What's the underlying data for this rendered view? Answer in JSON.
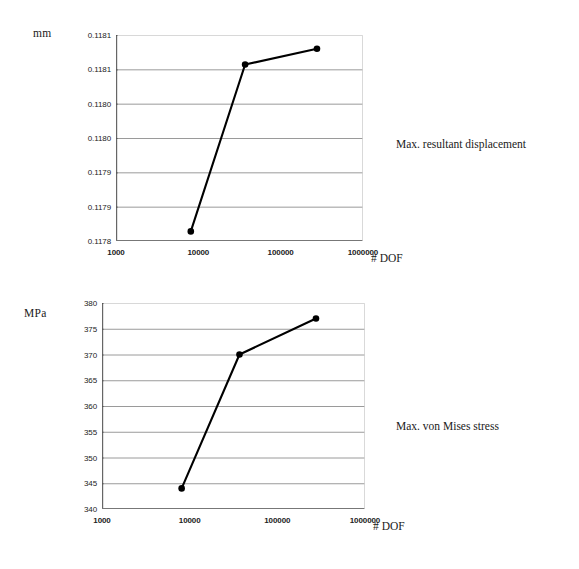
{
  "page": {
    "background": "#ffffff",
    "ink": "#1a1a1a",
    "gridline_color": "#9a9a9a",
    "series_color": "#000000"
  },
  "chart_data": [
    {
      "id": "max-resultant-displacement",
      "type": "line",
      "title": "",
      "caption": "Max. resultant displacement",
      "unit_label": "mm",
      "xlabel": "# DOF",
      "ylabel": "",
      "xscale": "log",
      "xlim": [
        1000,
        1000000
      ],
      "xticks": [
        1000,
        10000,
        100000,
        1000000
      ],
      "xticklabels": [
        "1000",
        "10000",
        "100000",
        "1000000"
      ],
      "ylim": [
        0.1178,
        0.1181
      ],
      "yticks": [
        0.1178,
        0.11785,
        0.1179,
        0.11795,
        0.118,
        0.11805,
        0.1181
      ],
      "yticklabels": [
        "0.1178",
        "0.1179",
        "0.1179",
        "0.1180",
        "0.1180",
        "0.1181",
        "0.1181"
      ],
      "grid": true,
      "marker": "filled-circle",
      "x": [
        8100,
        37000,
        276000
      ],
      "values": [
        0.117814,
        0.118057,
        0.11808
      ],
      "points": [
        {
          "x": 8100,
          "y": 0.117814
        },
        {
          "x": 37000,
          "y": 0.118057
        },
        {
          "x": 276000,
          "y": 0.11808
        }
      ]
    },
    {
      "id": "max-von-mises-stress",
      "type": "line",
      "title": "",
      "caption": "Max. von Mises stress",
      "unit_label": "MPa",
      "xlabel": "# DOF",
      "ylabel": "",
      "xscale": "log",
      "xlim": [
        1000,
        1000000
      ],
      "xticks": [
        1000,
        10000,
        100000,
        1000000
      ],
      "xticklabels": [
        "1000",
        "10000",
        "100000",
        "1000000"
      ],
      "ylim": [
        340,
        380
      ],
      "yticks": [
        340,
        345,
        350,
        355,
        360,
        365,
        370,
        375,
        380
      ],
      "yticklabels": [
        "340",
        "345",
        "350",
        "355",
        "360",
        "365",
        "370",
        "375",
        "380"
      ],
      "grid": true,
      "marker": "filled-circle",
      "x": [
        8100,
        37000,
        276000
      ],
      "values": [
        344,
        370,
        377
      ],
      "points": [
        {
          "x": 8100,
          "y": 344
        },
        {
          "x": 37000,
          "y": 370
        },
        {
          "x": 276000,
          "y": 377
        }
      ]
    }
  ]
}
